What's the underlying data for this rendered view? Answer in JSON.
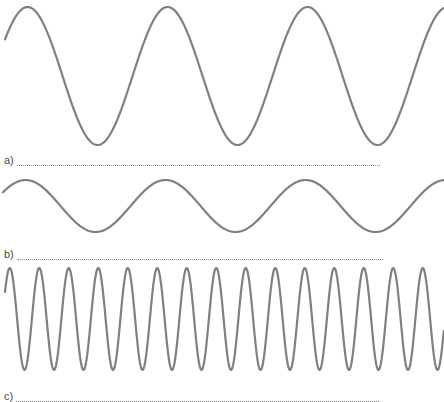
{
  "page": {
    "background_color": "#ffffff",
    "stroke_color": "#808080",
    "text_color": "#4a4a4a",
    "dot_color": "#8d8d8d"
  },
  "answers": [
    {
      "label": "a)",
      "value": ""
    },
    {
      "label": "b)",
      "value": ""
    },
    {
      "label": "c)",
      "value": ""
    }
  ],
  "chart_data": [
    {
      "type": "line",
      "name": "wave-a",
      "title": "",
      "xlabel": "",
      "ylabel": "",
      "waveform": "sine",
      "cycles": 3.15,
      "amplitude": 69,
      "wavelength": 140,
      "phase_deg": 32,
      "baseline_y": 76,
      "peak_y": 7,
      "trough_y": 145,
      "x_range": [
        5,
        444
      ],
      "ylim": [
        0,
        148
      ],
      "grid": false,
      "legend": false,
      "stroke_width": 2.2,
      "stroke": "#808080"
    },
    {
      "type": "line",
      "name": "wave-b",
      "title": "",
      "xlabel": "",
      "ylabel": "",
      "waveform": "sine",
      "cycles": 3.15,
      "amplitude": 26,
      "wavelength": 140,
      "phase_deg": 32,
      "baseline_y": 36,
      "peak_y": 10,
      "trough_y": 62,
      "x_range": [
        3,
        444
      ],
      "ylim": [
        0,
        72
      ],
      "grid": false,
      "legend": false,
      "stroke_width": 2.2,
      "stroke": "#808080"
    },
    {
      "type": "line",
      "name": "wave-c",
      "title": "",
      "xlabel": "",
      "ylabel": "",
      "waveform": "sine",
      "cycles": 15,
      "amplitude": 51,
      "wavelength": 29.5,
      "phase_deg": 32,
      "baseline_y": 57,
      "peak_y": 6,
      "trough_y": 108,
      "x_range": [
        5,
        444
      ],
      "ylim": [
        0,
        116
      ],
      "grid": false,
      "legend": false,
      "stroke_width": 2.2,
      "stroke": "#808080"
    }
  ]
}
